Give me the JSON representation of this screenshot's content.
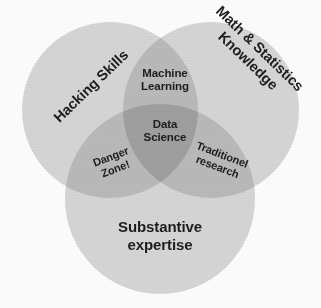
{
  "diagram": {
    "type": "venn",
    "set_count": 3,
    "canvas": {
      "width": 321,
      "height": 308
    },
    "background_color": "#fbfbfb",
    "colors": {
      "circle_fill": "#d4d4d4",
      "two_way_overlap": "#b8b8b8",
      "three_way_overlap": "#9e9e9e",
      "text": "#1d1d1d"
    },
    "circles": [
      {
        "id": "hacking",
        "label": "Hacking Skills",
        "cx": 110,
        "cy": 110,
        "r": 88,
        "fill": "#d4d4d4"
      },
      {
        "id": "mathstats",
        "label": "Math & Statistics\nKnowledge",
        "cx": 211,
        "cy": 110,
        "r": 88,
        "fill": "#d4d4d4"
      },
      {
        "id": "substantive",
        "label": "Substantive\nexpertise",
        "cx": 160,
        "cy": 199,
        "r": 95,
        "fill": "#d4d4d4"
      }
    ],
    "labels": {
      "hacking_skills": "Hacking Skills",
      "math_statistics_knowledge": "Math & Statistics\nKnowledge",
      "substantive_expertise": "Substantive\nexpertise",
      "machine_learning": "Machine\nLearning",
      "data_science": "Data\nScience",
      "danger_zone": "Danger\nZone!",
      "traditional_research": "Traditionel\nresearch"
    },
    "regions": [
      {
        "id": "machine-learning",
        "label": "Machine\nLearning",
        "sets": [
          "hacking",
          "mathstats"
        ],
        "rotation_deg": 0
      },
      {
        "id": "data-science",
        "label": "Data\nScience",
        "sets": [
          "hacking",
          "mathstats",
          "substantive"
        ],
        "rotation_deg": 0
      },
      {
        "id": "danger-zone",
        "label": "Danger\nZone!",
        "sets": [
          "hacking",
          "substantive"
        ],
        "rotation_deg": -21
      },
      {
        "id": "traditional-research",
        "label": "Traditionel\nresearch",
        "sets": [
          "mathstats",
          "substantive"
        ],
        "rotation_deg": 21
      }
    ]
  }
}
